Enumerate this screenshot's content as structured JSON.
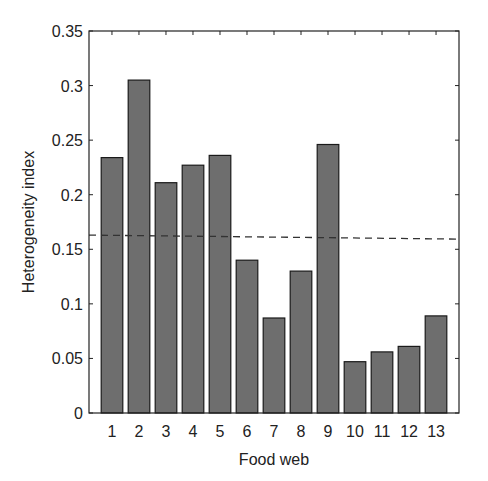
{
  "chart_data": {
    "type": "bar",
    "title": "",
    "xlabel": "Food web",
    "ylabel": "Heterogeneity index",
    "categories": [
      "1",
      "2",
      "3",
      "4",
      "5",
      "6",
      "7",
      "8",
      "9",
      "10",
      "11",
      "12",
      "13"
    ],
    "values": [
      0.234,
      0.305,
      0.211,
      0.227,
      0.236,
      0.14,
      0.087,
      0.13,
      0.246,
      0.047,
      0.056,
      0.061,
      0.089
    ],
    "ylim": [
      0,
      0.35
    ],
    "yticks": [
      0,
      0.05,
      0.1,
      0.15,
      0.2,
      0.25,
      0.3,
      0.35
    ],
    "ytick_labels": [
      "0",
      "0.05",
      "0.1",
      "0.15",
      "0.2",
      "0.25",
      "0.3",
      "0.35"
    ],
    "reference_line": {
      "style": "dashed",
      "value": 0.163
    },
    "grid": false,
    "legend": null,
    "bar_color": "#6e6e6e",
    "bar_edge_color": "#1a1a1a"
  }
}
